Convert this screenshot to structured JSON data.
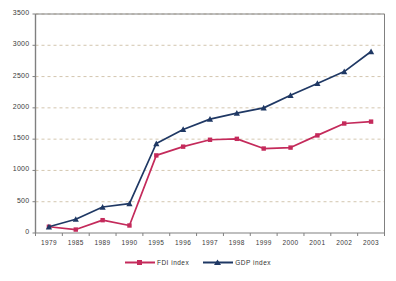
{
  "chart_data": {
    "type": "line",
    "title": "",
    "subtitle": "",
    "xlabel": "",
    "ylabel": "",
    "categories": [
      "1979",
      "1985",
      "1989",
      "1990",
      "1995",
      "1996",
      "1997",
      "1998",
      "1999",
      "2000",
      "2001",
      "2002",
      "2003"
    ],
    "series": [
      {
        "name": "FDI index",
        "color": "#C42A5B",
        "marker": "square",
        "values": [
          100,
          55,
          205,
          120,
          1240,
          1380,
          1490,
          1505,
          1350,
          1365,
          1560,
          1750,
          1780
        ]
      },
      {
        "name": "GDP index",
        "color": "#1F3864",
        "marker": "triangle",
        "values": [
          100,
          220,
          415,
          470,
          1430,
          1655,
          1820,
          1915,
          2000,
          2200,
          2390,
          2580,
          2900
        ]
      }
    ],
    "ylim": [
      0,
      3500
    ],
    "ytick_values": [
      0,
      500,
      1000,
      1500,
      2000,
      2500,
      3000,
      3500
    ],
    "ytick_labels": [
      "0",
      "500",
      "1000",
      "1500",
      "2000",
      "2500",
      "3000",
      "3500"
    ],
    "grid": {
      "horizontal": true,
      "vertical": false,
      "style": "dashed",
      "color": "#c8b89a"
    },
    "legend": {
      "position": "bottom",
      "entries": [
        {
          "label": "FDI index",
          "color": "#C42A5B"
        },
        {
          "label": "GDP index",
          "color": "#1F3864"
        }
      ]
    },
    "axis": {
      "frame_color": "#808080",
      "tick_color": "#808080"
    }
  }
}
